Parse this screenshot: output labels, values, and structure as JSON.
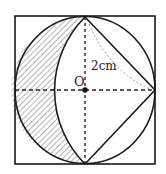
{
  "diagram": {
    "center_label": "O",
    "radius_label": "2cm",
    "colors": {
      "stroke": "#1a1a1a",
      "dashed": "#222222",
      "hatch": "#555555",
      "dotted_arc": "#888888",
      "background": "#ffffff"
    },
    "elements": [
      "square",
      "circle",
      "inscribed-triangle-right",
      "inner-arc",
      "hatched-crescent",
      "dashed-horizontal-diameter",
      "dashed-vertical-diameter",
      "dotted-radius-arc",
      "center-point"
    ]
  }
}
